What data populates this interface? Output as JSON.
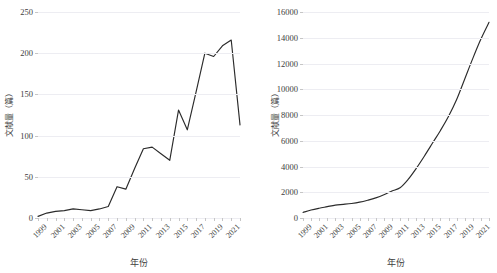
{
  "chart_data": [
    {
      "id": "left",
      "type": "line",
      "title": "",
      "xlabel": "年份",
      "ylabel": "文献量（篇）",
      "ylim": [
        0,
        250
      ],
      "yticks": [
        0,
        50,
        100,
        150,
        200,
        250
      ],
      "ytick_labels": [
        "0",
        "50",
        "100",
        "150",
        "200",
        "250"
      ],
      "grid": true,
      "legend": "none",
      "x": [
        1999,
        2000,
        2001,
        2002,
        2003,
        2004,
        2005,
        2006,
        2007,
        2008,
        2009,
        2010,
        2011,
        2012,
        2013,
        2014,
        2015,
        2016,
        2017,
        2018,
        2019,
        2020,
        2021
      ],
      "xtick_labels": [
        "1999",
        "2001",
        "2003",
        "2005",
        "2007",
        "2009",
        "2011",
        "2013",
        "2015",
        "2017",
        "2019",
        "2021"
      ],
      "series": [
        {
          "name": "文献量",
          "values": [
            2,
            6,
            8,
            9,
            11,
            10,
            9,
            11,
            14,
            38,
            35,
            60,
            84,
            86,
            78,
            70,
            131,
            107,
            153,
            200,
            196,
            209,
            216,
            113
          ]
        }
      ],
      "values": [
        2,
        6,
        8,
        9,
        11,
        10,
        9,
        11,
        14,
        38,
        35,
        60,
        84,
        86,
        78,
        70,
        131,
        107,
        153,
        200,
        196,
        209,
        216,
        113
      ]
    },
    {
      "id": "right",
      "type": "line",
      "title": "",
      "xlabel": "年份",
      "ylabel": "文献量（篇）",
      "ylim": [
        0,
        16000
      ],
      "yticks": [
        0,
        2000,
        4000,
        6000,
        8000,
        10000,
        12000,
        14000,
        16000
      ],
      "ytick_labels": [
        "0",
        "2000",
        "4000",
        "6000",
        "8000",
        "10000",
        "12000",
        "14000",
        "16000"
      ],
      "grid": true,
      "legend": "none",
      "x": [
        1999,
        2000,
        2001,
        2002,
        2003,
        2004,
        2005,
        2006,
        2007,
        2008,
        2009,
        2010,
        2011,
        2012,
        2013,
        2014,
        2015,
        2016,
        2017,
        2018,
        2019,
        2020,
        2021
      ],
      "xtick_labels": [
        "1999",
        "2001",
        "2003",
        "2005",
        "2007",
        "2009",
        "2011",
        "2013",
        "2015",
        "2017",
        "2019",
        "2021"
      ],
      "series": [
        {
          "name": "文献量",
          "values": [
            430,
            620,
            760,
            880,
            1000,
            1060,
            1130,
            1230,
            1380,
            1560,
            1800,
            2100,
            2350,
            3000,
            3850,
            4800,
            5800,
            6800,
            7900,
            9200,
            10800,
            12400,
            13900,
            15200
          ]
        }
      ],
      "values": [
        430,
        620,
        760,
        880,
        1000,
        1060,
        1130,
        1230,
        1380,
        1560,
        1800,
        2100,
        2350,
        3000,
        3850,
        4800,
        5800,
        6800,
        7900,
        9200,
        10800,
        12400,
        13900,
        15200
      ]
    }
  ],
  "colors": {
    "line": "#2b2b2b",
    "grid": "#ededf2",
    "text": "#3d3d3d",
    "background": "#ffffff"
  }
}
